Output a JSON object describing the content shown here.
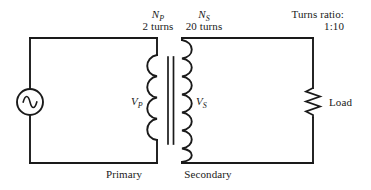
{
  "figure": {
    "kind": "transformer-circuit-schematic",
    "background_color": "#ffffff",
    "line_color": "#1a1a1a"
  },
  "labels": {
    "primary_winding_symbol": "N",
    "primary_winding_subscript": "P",
    "primary_turns": "2 turns",
    "secondary_winding_symbol": "N",
    "secondary_winding_subscript": "S",
    "secondary_turns": "20 turns",
    "turns_ratio_title": "Turns ratio:",
    "turns_ratio_value": "1:10",
    "primary_voltage_symbol": "V",
    "primary_voltage_subscript": "P",
    "secondary_voltage_symbol": "V",
    "secondary_voltage_subscript": "S",
    "load_label": "Load",
    "primary_side_label": "Primary",
    "secondary_side_label": "Secondary"
  },
  "components": {
    "ac_source": {
      "name": "ac-voltage-source",
      "symbol": "circle-with-sine-wave",
      "center_x": 30,
      "center_y": 102,
      "radius": 13
    },
    "primary_coil": {
      "name": "primary-winding-coil",
      "loops": 4,
      "x": 157,
      "top_y": 55,
      "bottom_y": 140
    },
    "transformer_core": {
      "name": "transformer-core",
      "line_count": 2,
      "x_positions": [
        168,
        173
      ],
      "top_y": 57,
      "bottom_y": 144
    },
    "secondary_coil": {
      "name": "secondary-winding-coil",
      "loops": 7,
      "x": 182,
      "top_y": 40,
      "bottom_y": 162
    },
    "load_resistor": {
      "name": "load-resistor",
      "symbol": "zigzag",
      "x": 313,
      "top_y": 88,
      "bottom_y": 118,
      "zigzag_segments": 6
    }
  },
  "wires": {
    "primary_loop": {
      "left_x": 30,
      "top_y": 38,
      "bottom_y": 163,
      "right_x": 157
    },
    "secondary_loop": {
      "left_x": 182,
      "top_y": 38,
      "bottom_y": 163,
      "right_x": 313
    }
  }
}
